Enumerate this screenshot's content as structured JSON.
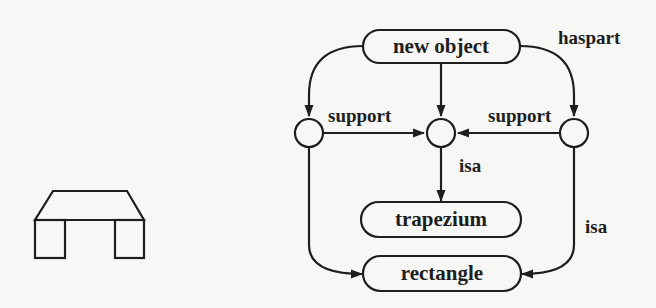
{
  "diagram": {
    "type": "semantic-network",
    "nodes": {
      "new_object": {
        "label": "new object",
        "shape": "rounded-rect"
      },
      "trapezium": {
        "label": "trapezium",
        "shape": "rounded-rect"
      },
      "rectangle": {
        "label": "rectangle",
        "shape": "rounded-rect"
      },
      "left_part": {
        "label": "",
        "shape": "circle"
      },
      "middle_part": {
        "label": "",
        "shape": "circle"
      },
      "right_part": {
        "label": "",
        "shape": "circle"
      }
    },
    "edge_labels": {
      "haspart": "haspart",
      "support_left": "support",
      "support_right": "support",
      "isa_middle": "isa",
      "isa_right": "isa"
    },
    "edges": [
      {
        "from": "new_object",
        "to": "left_part",
        "label": ""
      },
      {
        "from": "new_object",
        "to": "middle_part",
        "label": ""
      },
      {
        "from": "new_object",
        "to": "right_part",
        "label": "haspart"
      },
      {
        "from": "left_part",
        "to": "middle_part",
        "label": "support"
      },
      {
        "from": "right_part",
        "to": "middle_part",
        "label": "support"
      },
      {
        "from": "middle_part",
        "to": "trapezium",
        "label": "isa"
      },
      {
        "from": "left_part",
        "to": "rectangle",
        "label": ""
      },
      {
        "from": "right_part",
        "to": "rectangle",
        "label": "isa"
      }
    ],
    "illustration": {
      "description": "table-like object: trapezium top supported by two rectangles"
    },
    "colors": {
      "ink": "#1e1e1e",
      "paper": "#f7f7f5"
    }
  }
}
